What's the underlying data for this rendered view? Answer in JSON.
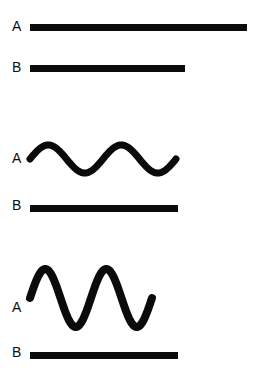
{
  "figure": {
    "background_color": "#ffffff",
    "ink_color": "#0b0b0b",
    "width": 257,
    "height": 375
  },
  "groups": [
    {
      "id": "group-1",
      "rows": [
        {
          "label": "A",
          "label_x": 12,
          "label_y": 19,
          "type": "line",
          "x": 30,
          "y": 24,
          "length": 217,
          "thickness": 7
        },
        {
          "label": "B",
          "label_x": 12,
          "label_y": 60,
          "type": "line",
          "x": 30,
          "y": 65,
          "length": 155,
          "thickness": 7
        }
      ]
    },
    {
      "id": "group-2",
      "rows": [
        {
          "label": "A",
          "label_x": 12,
          "label_y": 151,
          "type": "wave",
          "x": 30,
          "y": 130,
          "width": 146,
          "height": 48,
          "cycles": 2,
          "amplitude": 14,
          "thickness": 7,
          "baseline": 29
        },
        {
          "label": "B",
          "label_x": 12,
          "label_y": 198,
          "type": "line",
          "x": 30,
          "y": 205,
          "length": 148,
          "thickness": 7
        }
      ]
    },
    {
      "id": "group-3",
      "rows": [
        {
          "label": "A",
          "label_x": 12,
          "label_y": 300,
          "type": "wave",
          "x": 30,
          "y": 252,
          "width": 122,
          "height": 70,
          "cycles": 2,
          "amplitude": 29,
          "thickness": 8,
          "baseline": 46
        },
        {
          "label": "B",
          "label_x": 12,
          "label_y": 345,
          "type": "line",
          "x": 30,
          "y": 352,
          "length": 148,
          "thickness": 7
        }
      ]
    }
  ],
  "chart_data": {
    "type": "line",
    "xlabel": "",
    "ylabel": "",
    "grid": false,
    "legend_position": "left",
    "series": [
      {
        "name": "Group 1 — A",
        "waveform": "straight",
        "amplitude": 0,
        "cycles": 0,
        "length": 217
      },
      {
        "name": "Group 1 — B",
        "waveform": "straight",
        "amplitude": 0,
        "cycles": 0,
        "length": 155
      },
      {
        "name": "Group 2 — A",
        "waveform": "sinusoid",
        "amplitude": 14,
        "cycles": 2,
        "length": 146
      },
      {
        "name": "Group 2 — B",
        "waveform": "straight",
        "amplitude": 0,
        "cycles": 0,
        "length": 148
      },
      {
        "name": "Group 3 — A",
        "waveform": "sinusoid",
        "amplitude": 29,
        "cycles": 2,
        "length": 122
      },
      {
        "name": "Group 3 — B",
        "waveform": "straight",
        "amplitude": 0,
        "cycles": 0,
        "length": 148
      }
    ]
  }
}
